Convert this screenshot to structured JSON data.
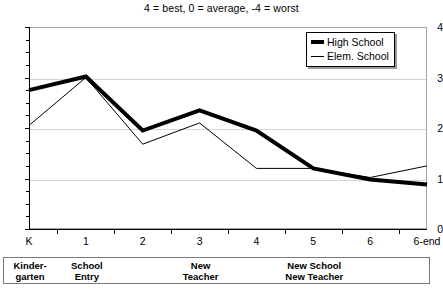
{
  "chart_data": {
    "type": "line",
    "title": "4 = best, 0 = average, -4 = worst",
    "xlabel": "",
    "ylabel": "",
    "ylim": [
      0,
      4
    ],
    "yticks": [
      "0",
      "1",
      "2",
      "3",
      "4"
    ],
    "grid": true,
    "legend_position": "top-right",
    "categories": [
      "K",
      "1",
      "2",
      "3",
      "4",
      "5",
      "6",
      "6-end"
    ],
    "series": [
      {
        "name": "High School",
        "style": "thick",
        "values": [
          2.75,
          3.02,
          1.95,
          2.35,
          1.95,
          1.2,
          0.98,
          0.88
        ]
      },
      {
        "name": "Elem. School",
        "style": "thin",
        "values": [
          2.05,
          3.0,
          1.68,
          2.1,
          1.2,
          1.2,
          1.02,
          1.25
        ]
      }
    ],
    "annotations": [
      {
        "label_line1": "Kinder-",
        "label_line2": "garten",
        "category": "K"
      },
      {
        "label_line1": "School",
        "label_line2": "Entry",
        "category": "1"
      },
      {
        "label_line1": "New",
        "label_line2": "Teacher",
        "category": "3"
      },
      {
        "label_line1": "New School",
        "label_line2": "New Teacher",
        "category": "5"
      }
    ]
  },
  "legend": {
    "items": [
      {
        "label": "High School"
      },
      {
        "label": "Elem. School"
      }
    ]
  },
  "colors": {
    "series_line": "#000000",
    "gridline": "#d4d4d4",
    "axis": "#000000",
    "plot_border": "#a6a6a6"
  }
}
